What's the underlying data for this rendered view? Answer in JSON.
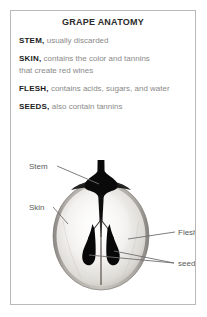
{
  "card": {
    "title": "GRAPE ANATOMY",
    "border_color": "#b9b9b9",
    "background": "#ffffff"
  },
  "facts": [
    {
      "term": "STEM,",
      "text": " usually discarded"
    },
    {
      "term": "SKIN,",
      "text": " contains the color and tannins"
    },
    {
      "term": "",
      "text": "that create red wines"
    },
    {
      "term": "FLESH,",
      "text": " contains acids, sugars, and water"
    },
    {
      "term": "SEEDS,",
      "text": " also contain tannins"
    }
  ],
  "diagram": {
    "caption_color": "#5b5b5b",
    "leader_color": "#6f6f6f",
    "labels": {
      "stem": "Stem",
      "skin": "Skin",
      "flesh": "Flesh",
      "seeds": "seeds"
    },
    "colors": {
      "skin_outline": "#7a7a7a",
      "flesh_light": "#f2f1ee",
      "flesh_mid": "#dcdad5",
      "seed": "#080808",
      "stem": "#0a0a0a",
      "core_line": "#6a635c"
    }
  }
}
